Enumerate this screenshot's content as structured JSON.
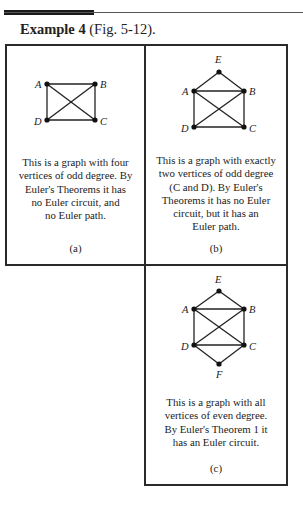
{
  "heading": {
    "bold": "Example 4",
    "rest": " (Fig. 5-12)."
  },
  "panels": [
    {
      "id": "a",
      "vertices": [
        "A",
        "B",
        "C",
        "D"
      ],
      "text": [
        "This is a graph with four",
        "vertices of odd degree. By",
        "Euler's Theorems it has",
        "no Euler circuit, and",
        "no Euler path."
      ],
      "caption": "(a)"
    },
    {
      "id": "b",
      "vertices": [
        "A",
        "B",
        "C",
        "D",
        "E"
      ],
      "text": [
        "This is a graph with exactly",
        "two vertices of odd degree",
        "(C and D).  By Euler's",
        "Theorems it has no Euler",
        "circuit, but it has an",
        "Euler path."
      ],
      "caption": "(b)"
    },
    {
      "id": "c",
      "vertices": [
        "A",
        "B",
        "C",
        "D",
        "E",
        "F"
      ],
      "text": [
        "This is a graph with all",
        "vertices of even degree.",
        "By Euler's Theorem 1 it",
        "has an Euler circuit."
      ],
      "caption": "(c)"
    }
  ]
}
